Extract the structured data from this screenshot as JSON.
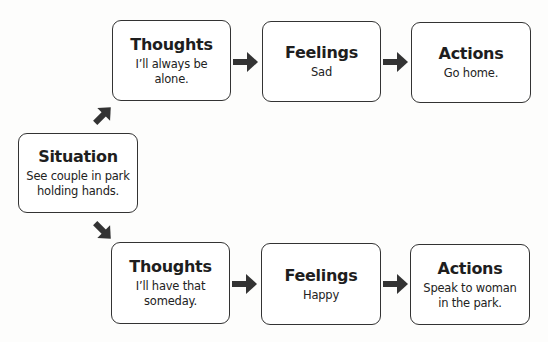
{
  "situation": {
    "title": "Situation",
    "text": "See couple in park holding hands."
  },
  "rows": [
    {
      "thoughts": {
        "title": "Thoughts",
        "text": "I’ll always be alone."
      },
      "feelings": {
        "title": "Feelings",
        "text": "Sad"
      },
      "actions": {
        "title": "Actions",
        "text": "Go home."
      }
    },
    {
      "thoughts": {
        "title": "Thoughts",
        "text": "I’ll have that someday."
      },
      "feelings": {
        "title": "Feelings",
        "text": "Happy"
      },
      "actions": {
        "title": "Actions",
        "text": "Speak to woman in the park."
      }
    }
  ],
  "colors": {
    "border": "#333333",
    "arrow": "#333333",
    "background": "#fdfdfc"
  }
}
